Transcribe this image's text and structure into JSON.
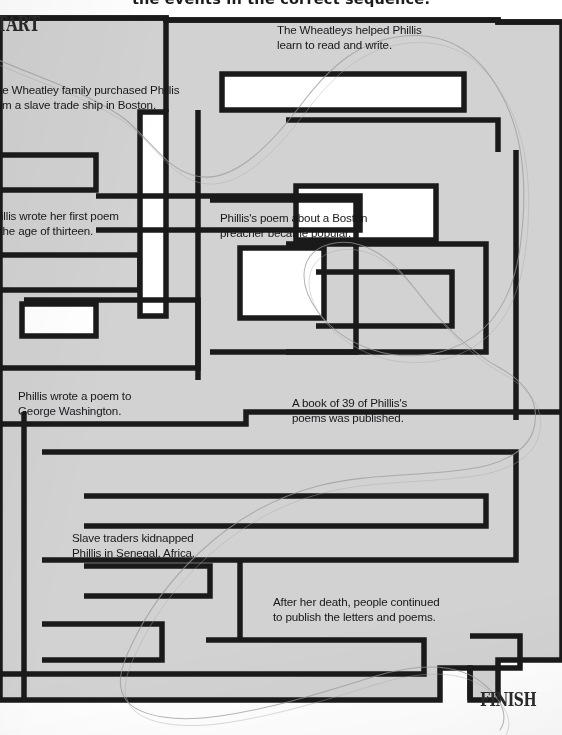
{
  "worksheet": {
    "title": "the events in the correct sequence.",
    "start_label": "START",
    "finish_label": "FINISH",
    "colors": {
      "maze_fill": "#d2d2d2",
      "corridor": "#ffffff",
      "wall": "#1a1a1a",
      "text": "#17171a",
      "pencil_trace": "#9a9a9a",
      "page": "#ffffff"
    }
  },
  "events": [
    {
      "id": "wheatleys-taught",
      "text": "The Wheatleys helped Phillis\nlearn to read and write.",
      "x": 277,
      "y": 22
    },
    {
      "id": "family-purchased",
      "text": "The Wheatley family purchased Phillis\nfrom a slave trade ship in Boston.",
      "x": -11,
      "y": 82
    },
    {
      "id": "first-poem-thirteen",
      "text": "Phillis wrote her first poem\nat the age of thirteen.",
      "x": -13,
      "y": 208
    },
    {
      "id": "boston-preacher-poem",
      "text": "Phillis's poem about a Boston\npreacher became popular.",
      "x": 220,
      "y": 210
    },
    {
      "id": "poem-to-washington",
      "text": "Phillis wrote a poem to\nGeorge Washington.",
      "x": 18,
      "y": 388
    },
    {
      "id": "book-of-39-poems",
      "text": "A book of 39 of Phillis's\npoems was published.",
      "x": 292,
      "y": 395
    },
    {
      "id": "kidnapped-senegal",
      "text": "Slave traders kidnapped\nPhillis in Senegal, Africa.",
      "x": 72,
      "y": 530
    },
    {
      "id": "published-after-death",
      "text": "After her death, people continued\nto publish the letters and poems.",
      "x": 273,
      "y": 594
    }
  ],
  "maze": {
    "outer": "M0,18 L166,18 L166,20 L498,20 L498,22 L562,22 L562,660 L498,660 L498,700 L470,700 L470,668 L440,668 L440,700 L0,700 Z",
    "walls": [
      {
        "id": "w-outer-top-left",
        "d": "M0,18 L166,18 L166,112"
      },
      {
        "id": "w-outer-top-right",
        "d": "M166,20 L498,20 L498,22 L562,22"
      },
      {
        "id": "w-top-pocket",
        "d": "M222,74 L464,74 L464,110 L222,110 Z"
      },
      {
        "id": "w-top-right-block",
        "d": "M286,120 L498,120 L498,152"
      },
      {
        "id": "w-inner-ring-a",
        "d": "M296,186 L436,186 L436,240 L296,240 Z"
      },
      {
        "id": "w-left-arm-1",
        "d": "M0,155 L96,155 L96,190 L0,190"
      },
      {
        "id": "w-left-arm-2",
        "d": "M0,255 L140,255 L140,290 L0,290"
      },
      {
        "id": "w-mid-cross-v",
        "d": "M140,112 L166,112 L166,316 L140,316 Z"
      },
      {
        "id": "w-mid-h",
        "d": "M96,196 L360,196 L360,230 L96,230"
      },
      {
        "id": "w-left-hook",
        "d": "M22,304 L96,304 L96,336 L22,336 Z"
      },
      {
        "id": "w-left-spiral",
        "d": "M0,368 L198,368 L198,300 L24,300"
      },
      {
        "id": "w-center-v",
        "d": "M198,110 L198,380"
      },
      {
        "id": "w-center-block",
        "d": "M210,200 L356,200 L356,352 L210,352"
      },
      {
        "id": "w-center-inner",
        "d": "M240,248 L324,248 L324,318 L240,318 Z"
      },
      {
        "id": "w-right-spiral-out",
        "d": "M286,244 L486,244 L486,352 L286,352"
      },
      {
        "id": "w-right-spiral-in",
        "d": "M316,272 L452,272 L452,326 L316,326"
      },
      {
        "id": "w-right-edge-v",
        "d": "M516,150 L516,420"
      },
      {
        "id": "w-mid-band",
        "d": "M0,424 L246,424 L246,412 L562,412"
      },
      {
        "id": "w-lower-left-box",
        "d": "M24,412 L24,700"
      },
      {
        "id": "w-lower-big",
        "d": "M42,452 L516,452 L516,560 L42,560"
      },
      {
        "id": "w-lower-inner-1",
        "d": "M84,496 L486,496 L486,526 L84,526"
      },
      {
        "id": "w-lower-inner-2",
        "d": "M84,566 L210,566 L210,596 L84,596"
      },
      {
        "id": "w-lower-inner-3",
        "d": "M240,560 L240,640"
      },
      {
        "id": "w-bottom-pocket",
        "d": "M42,624 L162,624 L162,660 L42,660"
      },
      {
        "id": "w-bottom-band",
        "d": "M206,640 L424,640 L424,674 L0,674"
      },
      {
        "id": "w-finish-step",
        "d": "M470,636 L520,636 L520,668 L470,668 L470,700"
      }
    ],
    "pencil_trace": "M-6,58 C40,78 96,96 126,120 C156,146 168,170 196,176 C232,184 268,148 300,106 C330,66 360,40 404,36 C452,32 480,56 500,92 C524,134 528,190 520,248 C512,304 486,340 440,352 C392,364 344,346 318,312 C296,282 300,252 330,244 C362,236 392,258 416,290 C442,324 470,352 500,368 C528,384 540,404 534,428 C528,452 500,466 462,470 C416,476 364,474 318,486 C272,498 232,522 200,552 C168,582 146,614 132,644 C120,668 116,686 126,700 C140,718 180,722 220,716 C276,708 330,690 376,676 C424,662 462,664 486,686 C504,702 508,718 500,730"
  }
}
